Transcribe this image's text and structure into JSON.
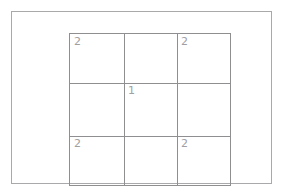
{
  "diagram": {
    "background_color": "#ffffff",
    "frame": {
      "name": "outer-frame",
      "border_color": "#a9a9ab"
    },
    "grid": {
      "rows": 3,
      "columns": 3,
      "line_color": "#8f8f92",
      "label_color": "#a0a0a3",
      "cells": [
        [
          {
            "label": "2"
          },
          {
            "label": ""
          },
          {
            "label": "2"
          }
        ],
        [
          {
            "label": ""
          },
          {
            "label": "1"
          },
          {
            "label": ""
          }
        ],
        [
          {
            "label": "2"
          },
          {
            "label": ""
          },
          {
            "label": "2"
          }
        ]
      ]
    }
  }
}
